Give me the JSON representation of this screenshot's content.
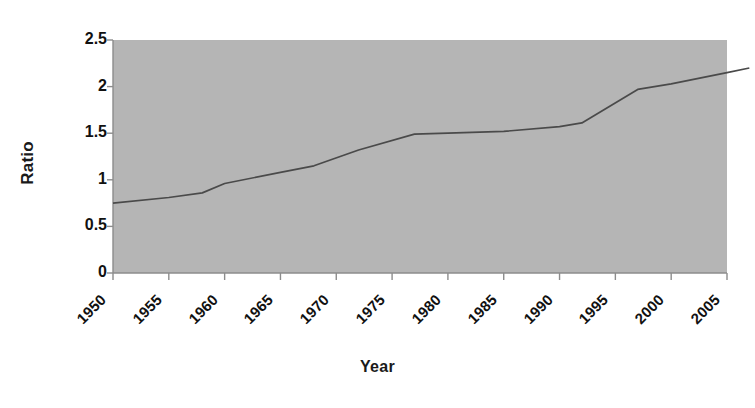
{
  "chart_data": {
    "type": "line",
    "title": "",
    "xlabel": "Year",
    "ylabel": "Ratio",
    "xlim": [
      1950,
      2007
    ],
    "ylim": [
      0,
      2.5
    ],
    "grid": false,
    "legend": null,
    "plot_background_color": "#b5b5b5",
    "line_color": "#4a4a4a",
    "axis_color": "#8c8c8c",
    "x_tick_labels": [
      "1950",
      "1955",
      "1960",
      "1965",
      "1970",
      "1975",
      "1980",
      "1985",
      "1990",
      "1995",
      "2000",
      "2005"
    ],
    "x_tick_values": [
      1950,
      1955,
      1960,
      1965,
      1970,
      1975,
      1980,
      1985,
      1990,
      1995,
      2000,
      2005
    ],
    "y_tick_labels": [
      "0",
      "0.5",
      "1",
      "1.5",
      "2",
      "2.5"
    ],
    "y_tick_values": [
      0,
      0.5,
      1,
      1.5,
      2,
      2.5
    ],
    "series": [
      {
        "name": "Ratio",
        "x": [
          1950,
          1955,
          1958,
          1960,
          1965,
          1968,
          1972,
          1977,
          1980,
          1985,
          1990,
          1992,
          1997,
          2000,
          2005,
          2007
        ],
        "values": [
          0.75,
          0.81,
          0.86,
          0.96,
          1.08,
          1.15,
          1.32,
          1.49,
          1.5,
          1.52,
          1.57,
          1.61,
          1.97,
          2.03,
          2.15,
          2.2
        ]
      }
    ]
  }
}
